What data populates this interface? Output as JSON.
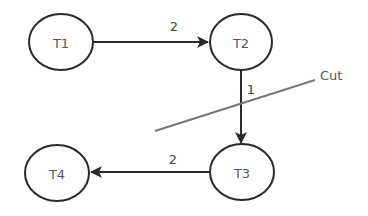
{
  "diagram": {
    "type": "directed-graph",
    "nodes": [
      {
        "id": "T1",
        "label": "T1",
        "cx": 61,
        "cy": 42
      },
      {
        "id": "T2",
        "label": "T2",
        "cx": 241,
        "cy": 42
      },
      {
        "id": "T3",
        "label": "T3",
        "cx": 242,
        "cy": 172
      },
      {
        "id": "T4",
        "label": "T4",
        "cx": 57,
        "cy": 173
      }
    ],
    "edges": [
      {
        "from": "T1",
        "to": "T2",
        "weight": "2"
      },
      {
        "from": "T2",
        "to": "T3",
        "weight": "1"
      },
      {
        "from": "T3",
        "to": "T4",
        "weight": "2"
      }
    ],
    "cut": {
      "label": "Cut"
    },
    "colors": {
      "stroke": "#2a2a2a",
      "cut": "#777777",
      "background": "#ffffff"
    }
  }
}
